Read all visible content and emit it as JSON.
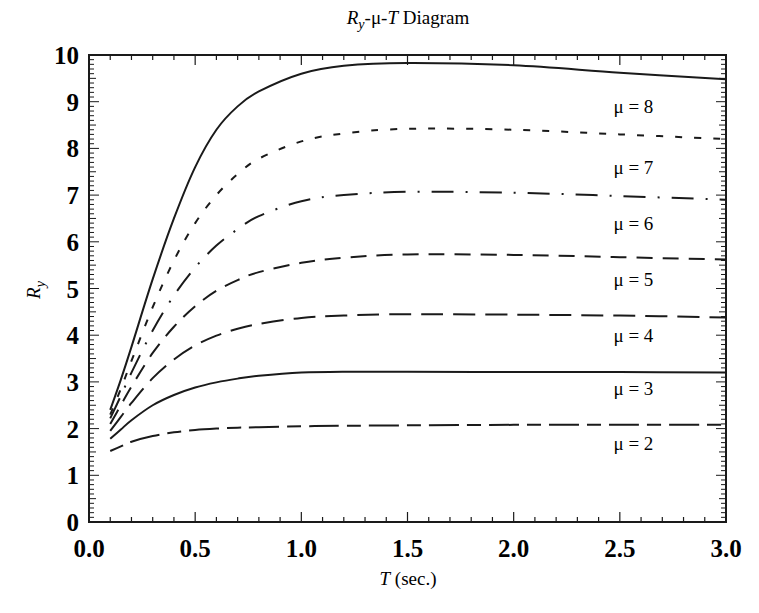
{
  "chart_data": {
    "type": "line",
    "title": "Ry-μ-T Diagram",
    "title_parts": {
      "r": "R",
      "sub": "y",
      "mid": "-μ-",
      "t": "T",
      "rest": " Diagram"
    },
    "xlabel": "T (sec.)",
    "xlabel_parts": {
      "t": "T",
      "rest": " (sec.)"
    },
    "ylabel": "Ry",
    "ylabel_parts": {
      "r": "R",
      "sub": "y"
    },
    "xlim": [
      0.0,
      3.0
    ],
    "ylim": [
      0,
      10
    ],
    "x_ticks": [
      "0.0",
      "0.5",
      "1.0",
      "1.5",
      "2.0",
      "2.5",
      "3.0"
    ],
    "y_ticks": [
      "0",
      "1",
      "2",
      "3",
      "4",
      "5",
      "6",
      "7",
      "8",
      "9",
      "10"
    ],
    "grid": false,
    "legend_position": "inline labels near right edge",
    "x": [
      0.1,
      0.15,
      0.2,
      0.3,
      0.4,
      0.5,
      0.6,
      0.7,
      0.8,
      1.0,
      1.2,
      1.5,
      2.0,
      2.5,
      3.0
    ],
    "series": [
      {
        "name": "μ = 2",
        "label": "μ = 2",
        "dash": "14,8,30,8",
        "values": [
          1.52,
          1.62,
          1.72,
          1.84,
          1.92,
          1.97,
          2.0,
          2.02,
          2.03,
          2.05,
          2.06,
          2.07,
          2.08,
          2.08,
          2.08
        ]
      },
      {
        "name": "μ = 3",
        "label": "μ = 3",
        "dash": "",
        "values": [
          1.78,
          1.98,
          2.18,
          2.5,
          2.72,
          2.88,
          2.99,
          3.07,
          3.13,
          3.2,
          3.22,
          3.22,
          3.21,
          3.21,
          3.2
        ]
      },
      {
        "name": "μ = 4",
        "label": "μ = 4",
        "dash": "22,10",
        "values": [
          1.95,
          2.25,
          2.55,
          3.08,
          3.48,
          3.78,
          3.99,
          4.14,
          4.24,
          4.37,
          4.42,
          4.45,
          4.44,
          4.42,
          4.38
        ]
      },
      {
        "name": "μ = 5",
        "label": "μ = 5",
        "dash": "16,10",
        "values": [
          2.1,
          2.5,
          2.9,
          3.62,
          4.18,
          4.62,
          4.95,
          5.18,
          5.35,
          5.55,
          5.66,
          5.73,
          5.72,
          5.67,
          5.62
        ]
      },
      {
        "name": "μ = 6",
        "label": "μ = 6",
        "dash": "22,12,2,12",
        "values": [
          2.22,
          2.7,
          3.2,
          4.1,
          4.85,
          5.45,
          5.92,
          6.27,
          6.55,
          6.87,
          7.0,
          7.07,
          7.05,
          6.98,
          6.9
        ]
      },
      {
        "name": "μ = 7",
        "label": "μ = 7",
        "dash": "7,12",
        "values": [
          2.3,
          2.85,
          3.45,
          4.6,
          5.6,
          6.4,
          7.0,
          7.45,
          7.78,
          8.15,
          8.32,
          8.42,
          8.4,
          8.3,
          8.2
        ]
      },
      {
        "name": "μ = 8",
        "label": "μ = 8",
        "dash": "",
        "values": [
          2.4,
          3.05,
          3.75,
          5.2,
          6.5,
          7.6,
          8.4,
          8.9,
          9.22,
          9.6,
          9.77,
          9.83,
          9.78,
          9.62,
          9.48
        ]
      }
    ],
    "label_positions": [
      {
        "series": "μ = 2",
        "x": 2.47,
        "y": 1.55
      },
      {
        "series": "μ = 3",
        "x": 2.47,
        "y": 2.72
      },
      {
        "series": "μ = 4",
        "x": 2.47,
        "y": 3.85
      },
      {
        "series": "μ = 5",
        "x": 2.47,
        "y": 5.05
      },
      {
        "series": "μ = 6",
        "x": 2.47,
        "y": 6.25
      },
      {
        "series": "μ = 7",
        "x": 2.47,
        "y": 7.45
      },
      {
        "series": "μ = 8",
        "x": 2.47,
        "y": 8.75
      }
    ]
  },
  "colors": {
    "line": "#1a1a1a",
    "background": "#ffffff",
    "axis": "#1a1a1a"
  }
}
